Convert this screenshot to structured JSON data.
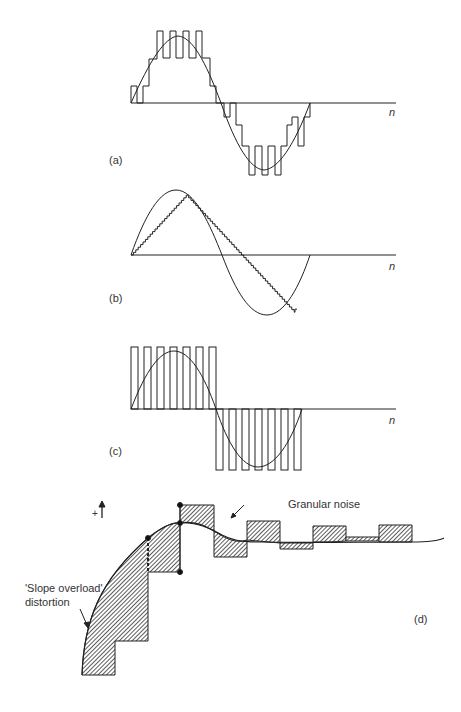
{
  "panels": {
    "a": {
      "label": "(a)",
      "axis_label": "n",
      "description": "Delta modulation with small step, sine approximated by staircase with granular oscillation"
    },
    "b": {
      "label": "(b)",
      "axis_label": "n",
      "description": "Delta modulation with step too small: slope overload, staircase lags sine"
    },
    "c": {
      "label": "(c)",
      "axis_label": "n",
      "description": "Step too large: output alternates between full positive and full negative"
    },
    "d": {
      "label": "(d)",
      "plus_sign": "+",
      "annotation_granular": "Granular noise",
      "annotation_slope_line1": "'Slope overload'",
      "annotation_slope_line2": "distortion"
    }
  },
  "colors": {
    "ink": "#222222",
    "hatch": "#555555",
    "background": "#ffffff"
  }
}
